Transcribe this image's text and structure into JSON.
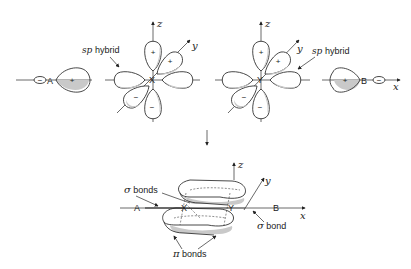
{
  "diagram": {
    "top": {
      "atom_a": {
        "label": "A",
        "small_lobe_sign": "−",
        "large_lobe_sign": "+"
      },
      "atom_x": {
        "label": "X",
        "hybrid_label_prefix": "sp",
        "hybrid_label_suffix": " hybrid",
        "axis_z": "z",
        "axis_y": "y",
        "lobe_signs": [
          "+",
          "+",
          "−",
          "−"
        ]
      },
      "atom_y": {
        "label": "Y",
        "hybrid_label_prefix": "sp",
        "hybrid_label_suffix": " hybrid",
        "axis_z": "z",
        "axis_y": "y",
        "lobe_signs": [
          "+",
          "+",
          "−",
          "−"
        ]
      },
      "atom_b": {
        "label": "B",
        "large_lobe_sign": "+",
        "small_lobe_sign": "−",
        "axis_x": "x"
      }
    },
    "bottom": {
      "atoms": [
        "A",
        "X",
        "Y",
        "B"
      ],
      "axis_z": "z",
      "axis_y": "y",
      "axis_x": "x",
      "sigma_bonds_label_symbol": "σ",
      "sigma_bonds_label_text": " bonds",
      "sigma_bond_label_symbol": "σ",
      "sigma_bond_label_text": " bond",
      "pi_bonds_label_symbol": "π",
      "pi_bonds_label_text": " bonds"
    }
  }
}
